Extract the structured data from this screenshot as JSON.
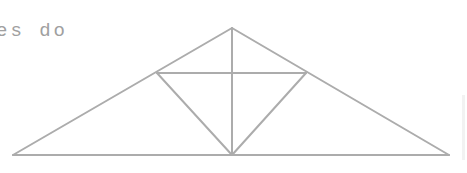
{
  "caption": {
    "text": "es do"
  },
  "diagram": {
    "type": "truss",
    "stroke": "#acacac",
    "stroke_width": 2,
    "nodes": {
      "apex": [
        232,
        28
      ],
      "left_base": [
        13,
        155
      ],
      "right_base": [
        449,
        155
      ],
      "center_base": [
        232,
        155
      ],
      "left_mid": [
        157,
        73
      ],
      "right_mid": [
        306,
        73
      ]
    },
    "members": [
      [
        "left_base",
        "apex"
      ],
      [
        "apex",
        "right_base"
      ],
      [
        "left_base",
        "right_base"
      ],
      [
        "apex",
        "center_base"
      ],
      [
        "left_mid",
        "right_mid"
      ],
      [
        "left_mid",
        "center_base"
      ],
      [
        "right_mid",
        "center_base"
      ]
    ]
  }
}
